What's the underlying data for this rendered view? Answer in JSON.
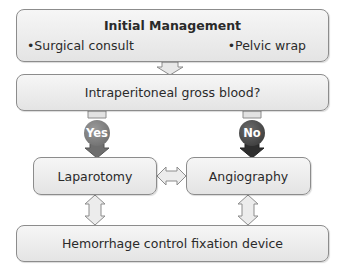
{
  "diagram": {
    "initial_management": {
      "title": "Initial Management",
      "bullets": [
        "•Surgical consult",
        "•Pelvic wrap"
      ]
    },
    "question": "Intraperitoneal gross blood?",
    "branches": {
      "yes": "Yes",
      "no": "No"
    },
    "laparotomy": "Laparotomy",
    "angiography": "Angiography",
    "final": "Hemorrhage control fixation device"
  },
  "colors": {
    "box_fill": "#ececec",
    "box_border": "#8c8c8c",
    "yes_badge": "#7a7a7a",
    "no_badge": "#444444",
    "arrow_fill": "#e2e2e2"
  }
}
